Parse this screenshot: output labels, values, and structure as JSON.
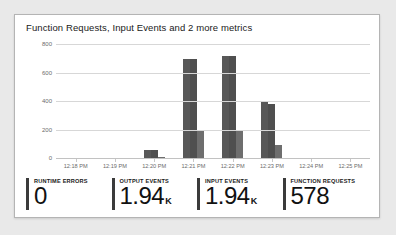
{
  "card": {
    "title": "Function Requests, Input Events and 2 more metrics"
  },
  "chart_data": {
    "type": "bar",
    "title": "Function Requests, Input Events and 2 more metrics",
    "xlabel": "",
    "ylabel": "",
    "ylim": [
      0,
      800
    ],
    "yticks": [
      0,
      200,
      400,
      600,
      800
    ],
    "grid": true,
    "legend": "none",
    "categories": [
      "12:18 PM",
      "12:19 PM",
      "12:20 PM",
      "12:21 PM",
      "12:22 PM",
      "12:23 PM",
      "12:24 PM",
      "12:25 PM"
    ],
    "series": [
      {
        "name": "Input Events",
        "color": "#585858",
        "values": [
          0,
          0,
          62,
          700,
          720,
          398,
          0,
          0
        ]
      },
      {
        "name": "Output Events",
        "color": "#4f4f4f",
        "values": [
          0,
          0,
          60,
          705,
          725,
          385,
          0,
          0
        ]
      },
      {
        "name": "Function Requests",
        "color": "#6e6e6e",
        "values": [
          0,
          0,
          12,
          205,
          200,
          100,
          0,
          0
        ]
      }
    ]
  },
  "kpis": [
    {
      "label": "Runtime Errors",
      "value": "0",
      "unit": ""
    },
    {
      "label": "Output Events",
      "value": "1.94",
      "unit": "K"
    },
    {
      "label": "Input Events",
      "value": "1.94",
      "unit": "K"
    },
    {
      "label": "Function Requests",
      "value": "578",
      "unit": ""
    }
  ]
}
